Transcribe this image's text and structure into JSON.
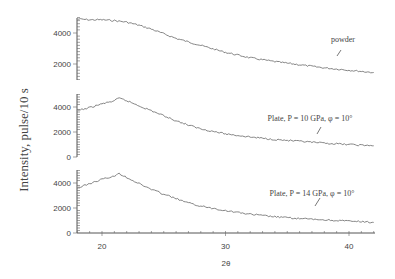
{
  "chart_data": {
    "type": "line",
    "layout": "3 vertically stacked panels sharing x-axis",
    "title": "",
    "xlabel": "2θ",
    "ylabel": "Intensity, pulse/10 s",
    "xlim": [
      18,
      42
    ],
    "x_ticks": [
      20,
      30,
      40
    ],
    "grid": false,
    "legend": "inline annotations with arrows",
    "panels": [
      {
        "name": "powder",
        "annotation": "powder",
        "ylim": [
          1000,
          5000
        ],
        "y_ticks": [
          2000,
          4000
        ],
        "x": [
          18,
          19,
          20,
          21,
          22,
          23,
          24,
          25,
          26,
          28,
          30,
          32,
          34,
          36,
          38,
          40,
          42
        ],
        "values": [
          4900,
          4850,
          4850,
          4800,
          4700,
          4500,
          4250,
          3950,
          3650,
          3200,
          2750,
          2400,
          2150,
          1950,
          1750,
          1600,
          1450
        ]
      },
      {
        "name": "plate-10gpa",
        "annotation": "Plate, P = 10 GPa,  φ = 10°",
        "ylim": [
          0,
          5000
        ],
        "y_ticks": [
          0,
          2000,
          4000
        ],
        "x": [
          18,
          19,
          20,
          21,
          21.4,
          22,
          23,
          24,
          25,
          26,
          27,
          28,
          30,
          32,
          34,
          36,
          38,
          40,
          42
        ],
        "values": [
          3700,
          3950,
          4250,
          4500,
          4700,
          4500,
          4100,
          3700,
          3300,
          2900,
          2550,
          2250,
          1850,
          1600,
          1400,
          1250,
          1100,
          1000,
          900
        ]
      },
      {
        "name": "plate-14gpa",
        "annotation": "Plate, P = 14 GPa,  φ = 10°",
        "ylim": [
          0,
          5000
        ],
        "y_ticks": [
          0,
          2000,
          4000
        ],
        "x": [
          18,
          19,
          20,
          21,
          21.4,
          22,
          23,
          24,
          25,
          26,
          27,
          28,
          30,
          32,
          34,
          36,
          38,
          40,
          42
        ],
        "values": [
          3600,
          3950,
          4300,
          4550,
          4750,
          4450,
          3950,
          3500,
          3100,
          2750,
          2400,
          2150,
          1800,
          1500,
          1300,
          1150,
          1050,
          950,
          850
        ]
      }
    ]
  },
  "labels": {
    "ylabel": "Intensity, pulse/10 s",
    "xlabel": "2θ",
    "ann_powder": "powder",
    "ann_p10": "Plate, P = 10 GPa,  φ = 10°",
    "ann_p14": "Plate, P = 14 GPa,  φ = 10°"
  }
}
